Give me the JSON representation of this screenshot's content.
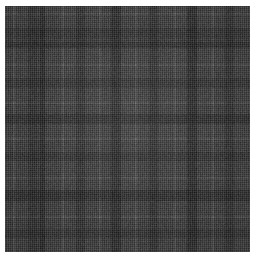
{
  "image": {
    "subject": "tartan-plaid-fabric-swatch",
    "description": "Grey woven tartan / plaid textile swatch photographed square-on",
    "canvas_width": 255,
    "canvas_height": 258,
    "background_color": "#ffffff",
    "margin_left": 5,
    "margin_top": 6,
    "swatch_width": 245,
    "swatch_height": 246
  },
  "palette": {
    "darkest": "#2e2e2e",
    "dark": "#3c3c3c",
    "mid_dark": "#4f4f4f",
    "mid": "#5e5e5e",
    "base": "#6b6b6b",
    "light": "#7d7d7d",
    "lightest": "#8d8d8d",
    "pin_stripe": "#9a9a9a"
  },
  "sett": {
    "type": "symmetric-tartan",
    "thread_count_note": "repeating block sett, mirrored",
    "warp_bands": [
      {
        "offset": 0,
        "width": 8,
        "color": "#636363"
      },
      {
        "offset": 8,
        "width": 2,
        "color": "#909090"
      },
      {
        "offset": 10,
        "width": 13,
        "color": "#666666"
      },
      {
        "offset": 23,
        "width": 9,
        "color": "#4a4a4a"
      },
      {
        "offset": 32,
        "width": 3,
        "color": "#585858"
      },
      {
        "offset": 35,
        "width": 5,
        "color": "#3a3a3a"
      },
      {
        "offset": 40,
        "width": 17,
        "color": "#686868"
      },
      {
        "offset": 57,
        "width": 2,
        "color": "#949494"
      },
      {
        "offset": 59,
        "width": 12,
        "color": "#6d6d6d"
      },
      {
        "offset": 71,
        "width": 9,
        "color": "#4d4d4d"
      },
      {
        "offset": 80,
        "width": 14,
        "color": "#6a6a6a"
      },
      {
        "offset": 94,
        "width": 2,
        "color": "#8f8f8f"
      },
      {
        "offset": 96,
        "width": 10,
        "color": "#676767"
      },
      {
        "offset": 106,
        "width": 10,
        "color": "#3f3f3f"
      },
      {
        "offset": 116,
        "width": 14,
        "color": "#6c6c6c"
      },
      {
        "offset": 130,
        "width": 2,
        "color": "#919191"
      },
      {
        "offset": 132,
        "width": 12,
        "color": "#676767"
      },
      {
        "offset": 144,
        "width": 9,
        "color": "#4b4b4b"
      },
      {
        "offset": 153,
        "width": 16,
        "color": "#6a6a6a"
      },
      {
        "offset": 169,
        "width": 2,
        "color": "#8e8e8e"
      },
      {
        "offset": 171,
        "width": 11,
        "color": "#6b6b6b"
      },
      {
        "offset": 182,
        "width": 10,
        "color": "#3d3d3d"
      },
      {
        "offset": 192,
        "width": 15,
        "color": "#696969"
      },
      {
        "offset": 207,
        "width": 2,
        "color": "#929292"
      },
      {
        "offset": 209,
        "width": 11,
        "color": "#676767"
      },
      {
        "offset": 220,
        "width": 9,
        "color": "#4c4c4c"
      },
      {
        "offset": 229,
        "width": 16,
        "color": "#6a6a6a"
      }
    ],
    "weft_bands": [
      {
        "offset": 0,
        "height": 7,
        "color": "#6e6e6e"
      },
      {
        "offset": 7,
        "height": 2,
        "color": "#8f8f8f"
      },
      {
        "offset": 9,
        "height": 13,
        "color": "#6a6a6a"
      },
      {
        "offset": 22,
        "height": 10,
        "color": "#4a4a4a"
      },
      {
        "offset": 32,
        "height": 4,
        "color": "#5a5a5a"
      },
      {
        "offset": 36,
        "height": 6,
        "color": "#3b3b3b"
      },
      {
        "offset": 42,
        "height": 16,
        "color": "#6c6c6c"
      },
      {
        "offset": 58,
        "height": 2,
        "color": "#929292"
      },
      {
        "offset": 60,
        "height": 12,
        "color": "#6a6a6a"
      },
      {
        "offset": 72,
        "height": 10,
        "color": "#4d4d4d"
      },
      {
        "offset": 82,
        "height": 14,
        "color": "#6b6b6b"
      },
      {
        "offset": 96,
        "height": 2,
        "color": "#8e8e8e"
      },
      {
        "offset": 98,
        "height": 10,
        "color": "#686868"
      },
      {
        "offset": 108,
        "height": 10,
        "color": "#3f3f3f"
      },
      {
        "offset": 118,
        "height": 14,
        "color": "#6c6c6c"
      },
      {
        "offset": 132,
        "height": 2,
        "color": "#919191"
      },
      {
        "offset": 134,
        "height": 12,
        "color": "#676767"
      },
      {
        "offset": 146,
        "height": 9,
        "color": "#4b4b4b"
      },
      {
        "offset": 155,
        "height": 16,
        "color": "#6a6a6a"
      },
      {
        "offset": 171,
        "height": 2,
        "color": "#8f8f8f"
      },
      {
        "offset": 173,
        "height": 11,
        "color": "#6b6b6b"
      },
      {
        "offset": 184,
        "height": 11,
        "color": "#3d3d3d"
      },
      {
        "offset": 195,
        "height": 15,
        "color": "#6a6a6a"
      },
      {
        "offset": 210,
        "height": 2,
        "color": "#939393"
      },
      {
        "offset": 212,
        "height": 11,
        "color": "#676767"
      },
      {
        "offset": 223,
        "height": 9,
        "color": "#4c4c4c"
      },
      {
        "offset": 232,
        "height": 14,
        "color": "#6b6b6b"
      }
    ]
  }
}
